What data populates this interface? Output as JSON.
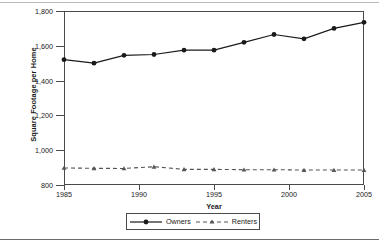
{
  "chart_data": {
    "type": "line",
    "title": "",
    "xlabel": "Year",
    "ylabel": "Square Footage per Home",
    "x": [
      1985,
      1987,
      1989,
      1991,
      1993,
      1995,
      1997,
      1999,
      2001,
      2003,
      2005
    ],
    "xlim": [
      1985,
      2005
    ],
    "ylim": [
      800,
      1800
    ],
    "xticks": [
      1985,
      1990,
      1995,
      2000,
      2005
    ],
    "xtick_labels": [
      "1985",
      "1990",
      "1995",
      "2000",
      "2005"
    ],
    "yticks": [
      800,
      1000,
      1200,
      1400,
      1600,
      1800
    ],
    "ytick_labels": [
      "800",
      "1,000",
      "1,200",
      "1,400",
      "1,600",
      "1,800"
    ],
    "grid": false,
    "legend_position": "below-axes",
    "series": [
      {
        "name": "Owners",
        "line_style": "solid",
        "marker": "circle",
        "color": "#1a1a1a",
        "values": [
          1520,
          1500,
          1545,
          1550,
          1575,
          1575,
          1620,
          1665,
          1640,
          1700,
          1735
        ]
      },
      {
        "name": "Renters",
        "line_style": "dashed",
        "marker": "triangle",
        "color": "#555555",
        "values": [
          898,
          896,
          895,
          905,
          890,
          890,
          888,
          888,
          886,
          886,
          886
        ]
      }
    ]
  },
  "legend": {
    "entries": [
      {
        "label": "Owners"
      },
      {
        "label": "Renters"
      }
    ]
  }
}
